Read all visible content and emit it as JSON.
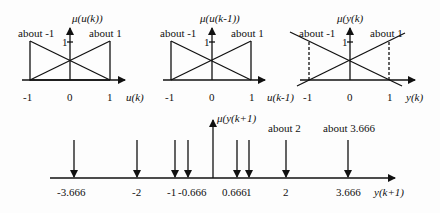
{
  "panels": [
    {
      "axis_title": "μ(u(k))",
      "left_label": "about -1",
      "right_label": "about 1",
      "peak_tick": "1",
      "ticks": [
        "-1",
        "0",
        "1"
      ],
      "x_axis_label": "u(k)"
    },
    {
      "axis_title": "μ(u(k-1))",
      "left_label": "about -1",
      "right_label": "about 1",
      "peak_tick": "1",
      "ticks": [
        "-1",
        "0",
        "1"
      ],
      "x_axis_label": "u(k-1)"
    },
    {
      "axis_title": "μ(y(k)",
      "left_label": "about -1",
      "right_label": "about 1",
      "peak_tick": "1",
      "ticks": [
        "-1",
        "0",
        "1"
      ],
      "x_axis_label": "y(k)"
    }
  ],
  "output": {
    "axis_title": "μ(y(k+1)",
    "x_axis_label": "y(k+1)",
    "singleton_labels": [
      "about 2",
      "about 3.666"
    ],
    "ticks": [
      "-3.666",
      "-2",
      "-1",
      "-0.666",
      "0.666",
      "1",
      "2",
      "3.666"
    ]
  },
  "colors": {
    "line": "#111111",
    "background": "#fdfdfd"
  }
}
